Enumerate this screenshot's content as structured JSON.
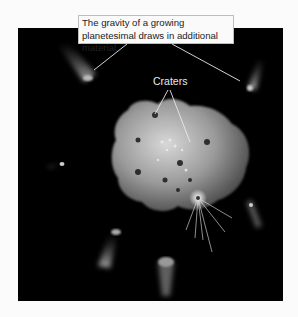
{
  "figure": {
    "callout_text": "The gravity of a growing planetesimal draws in additional material.",
    "crater_label": "Craters",
    "colors": {
      "background": "#fbfbfb",
      "space": "#000000",
      "callout_bg": "#fafafa",
      "callout_border": "#bdbdbd",
      "planetesimal": "#9a9a9a"
    }
  }
}
